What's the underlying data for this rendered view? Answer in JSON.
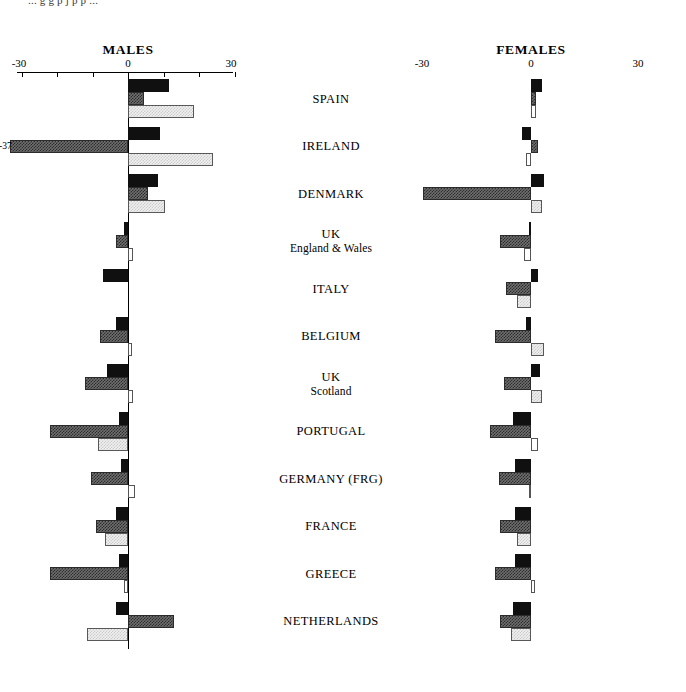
{
  "top_note": "... g   g p  j p  p ...",
  "panels": [
    {
      "id": "males",
      "title": "MALES",
      "axis_min_label": "-30",
      "axis_zero_label": "0",
      "axis_max_label": "30"
    },
    {
      "id": "females",
      "title": "FEMALES",
      "axis_min_label": "-30",
      "axis_zero_label": "0",
      "axis_max_label": "30"
    }
  ],
  "countries": [
    "SPAIN",
    "IRELAND",
    "DENMARK",
    "UK",
    "ITALY",
    "BELGIUM",
    "UK",
    "PORTUGAL",
    "GERMANY (FRG)",
    "FRANCE",
    "GREECE",
    "NETHERLANDS"
  ],
  "country_subs": [
    "",
    "",
    "",
    "England & Wales",
    "",
    "",
    "Scotland",
    "",
    "",
    "",
    "",
    ""
  ],
  "annotations": [
    {
      "panel": "males",
      "country": "IRELAND",
      "series": "middle",
      "text": "-37"
    }
  ],
  "chart_data": {
    "type": "bar",
    "title": "",
    "orientation": "horizontal",
    "xlabel": "",
    "ylabel": "",
    "xlim": [
      -30,
      30
    ],
    "xticks": [
      -30,
      -20,
      -10,
      0,
      10,
      20,
      30
    ],
    "xtick_labels": [
      "-30",
      "",
      "",
      "0",
      "",
      "",
      "30"
    ],
    "grid": false,
    "legend": "none",
    "categories": [
      "SPAIN",
      "IRELAND",
      "DENMARK",
      "UK England & Wales",
      "ITALY",
      "BELGIUM",
      "UK Scotland",
      "PORTUGAL",
      "GERMANY (FRG)",
      "FRANCE",
      "GREECE",
      "NETHERLANDS"
    ],
    "panels": [
      {
        "name": "MALES",
        "series": [
          {
            "name": "bar-1-black",
            "values": [
              11.5,
              9.0,
              8.5,
              -1.0,
              -7.0,
              -3.5,
              -6.0,
              -2.5,
              -2.0,
              -3.5,
              -2.5,
              -3.5
            ]
          },
          {
            "name": "bar-2-hatch",
            "values": [
              4.5,
              -37.0,
              5.5,
              -3.5,
              0.0,
              -8.0,
              -12.0,
              -22.0,
              -10.5,
              -9.0,
              -22.0,
              13.0
            ]
          },
          {
            "name": "bar-3-light",
            "values": [
              18.5,
              24.0,
              10.5,
              1.5,
              0.0,
              1.0,
              1.5,
              -8.5,
              2.0,
              -6.5,
              -1.0,
              -11.5
            ]
          }
        ]
      },
      {
        "name": "FEMALES",
        "series": [
          {
            "name": "bar-1-black",
            "values": [
              3.0,
              -2.5,
              3.5,
              -0.5,
              2.0,
              -1.5,
              2.5,
              -5.0,
              -4.5,
              -4.5,
              -4.5,
              -5.0
            ]
          },
          {
            "name": "bar-2-hatch",
            "values": [
              1.5,
              2.0,
              -30.0,
              -8.5,
              -7.0,
              -10.0,
              -7.5,
              -11.5,
              -9.0,
              -8.5,
              -10.0,
              -8.5
            ]
          },
          {
            "name": "bar-3-light",
            "values": [
              1.5,
              -1.5,
              3.0,
              -2.0,
              -4.0,
              3.5,
              3.0,
              2.0,
              -0.5,
              -4.0,
              1.0,
              -5.5
            ]
          }
        ]
      }
    ]
  },
  "layout": {
    "males_axis_left_px": 17,
    "males_axis_right_px": 233,
    "males_zero_px": 128,
    "females_axis_left_px": 420,
    "females_axis_right_px": 640,
    "females_zero_px": 531,
    "axis_y_px": 72,
    "row_start_y_px": 79,
    "row_height_px": 47.5,
    "bar_height_px": 13,
    "px_per_unit_males": 3.55,
    "px_per_unit_females": 3.6
  }
}
